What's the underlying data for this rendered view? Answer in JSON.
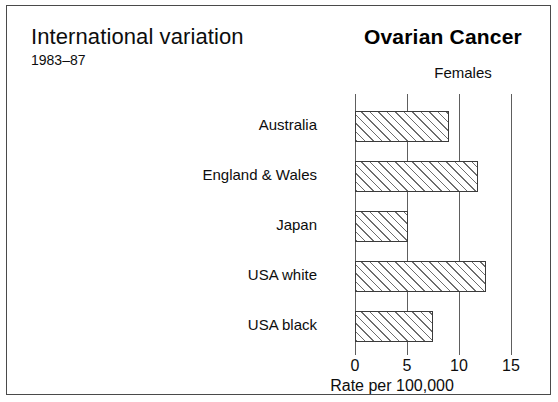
{
  "figure": {
    "main_title": "International variation",
    "subtitle": "1983–87",
    "cancer_title": "Ovarian Cancer",
    "sex_label": "Females",
    "axis_title": "Rate per 100,000",
    "border_color": "#4a4a4a",
    "bar_outline_color": "#3b3b3b",
    "bar_hatch_color": "#6d6d6d",
    "gridline_color": "#5e5e5e"
  },
  "chart_data": {
    "type": "bar",
    "orientation": "horizontal",
    "title": "Ovarian Cancer",
    "subtitle": "International variation 1983–87",
    "xlabel": "Rate per 100,000",
    "ylabel": "",
    "categories": [
      "Australia",
      "England & Wales",
      "Japan",
      "USA white",
      "USA black"
    ],
    "values": [
      9.0,
      11.8,
      5.1,
      12.6,
      7.5
    ],
    "series": [
      {
        "name": "Females",
        "values": [
          9.0,
          11.8,
          5.1,
          12.6,
          7.5
        ]
      }
    ],
    "xlim": [
      0,
      15
    ],
    "xticks": [
      0,
      5,
      10,
      15
    ],
    "xtick_labels": [
      "0",
      "5",
      "10",
      "15"
    ],
    "grid": true,
    "grid_axis": "x",
    "legend": false,
    "bar_fill": "hatched-diagonal",
    "annotations": [
      "Females"
    ]
  }
}
